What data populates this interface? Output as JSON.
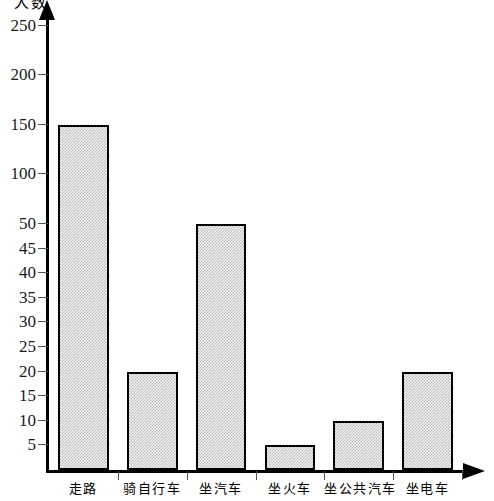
{
  "chart_data": {
    "type": "bar",
    "title": "",
    "ylabel": "人数",
    "xlabel": "",
    "categories": [
      "走路",
      "骑自行车",
      "坐汽车",
      "坐火车",
      "坐公共汽车",
      "坐电车"
    ],
    "values": [
      150,
      20,
      50,
      5,
      10,
      20
    ],
    "series": [
      {
        "name": "人数",
        "values": [
          150,
          20,
          50,
          5,
          10,
          20
        ]
      }
    ],
    "y_ticks": [
      5,
      10,
      15,
      20,
      25,
      30,
      35,
      40,
      45,
      50,
      100,
      150,
      200,
      250
    ],
    "y_tick_labels": [
      "5",
      "10",
      "15",
      "20",
      "25",
      "30",
      "35",
      "40",
      "45",
      "50",
      "100",
      "150",
      "200",
      "250"
    ],
    "ylim": [
      0,
      275
    ],
    "y_scale_note": "broken axis: 5-50 in steps of 5, then 50-250 in steps of 50",
    "grid": false,
    "legend": null,
    "bar_fill": "#d9d9d9",
    "bar_edge": "#000000",
    "axis_color": "#000000"
  },
  "axis": {
    "y_title": "人数"
  }
}
